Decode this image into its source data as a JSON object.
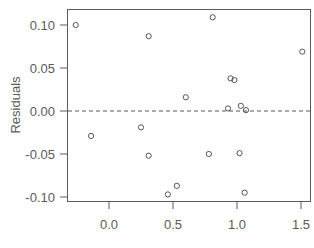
{
  "chart_data": {
    "type": "scatter",
    "title": "",
    "xlabel": "",
    "ylabel": "Residuals",
    "xlim": [
      -0.3,
      1.58
    ],
    "ylim": [
      -0.106,
      0.118
    ],
    "xticks": [
      0.0,
      0.5,
      1.0,
      1.5
    ],
    "xtick_labels": [
      "0.0",
      "0.5",
      "1.0",
      "1.5"
    ],
    "yticks": [
      -0.1,
      -0.05,
      0.0,
      0.05,
      0.1
    ],
    "ytick_labels": [
      "-0.10",
      "-0.05",
      "0.00",
      "0.05",
      "0.10"
    ],
    "grid": false,
    "legend": null,
    "reference_line": {
      "y": 0.0,
      "style": "dashed"
    },
    "points": [
      {
        "x": -0.26,
        "y": 0.1
      },
      {
        "x": -0.14,
        "y": -0.029
      },
      {
        "x": 0.25,
        "y": -0.019
      },
      {
        "x": 0.31,
        "y": 0.087
      },
      {
        "x": 0.31,
        "y": -0.052
      },
      {
        "x": 0.46,
        "y": -0.097
      },
      {
        "x": 0.53,
        "y": -0.087
      },
      {
        "x": 0.6,
        "y": 0.016
      },
      {
        "x": 0.78,
        "y": -0.05
      },
      {
        "x": 0.81,
        "y": 0.109
      },
      {
        "x": 0.93,
        "y": 0.003
      },
      {
        "x": 0.95,
        "y": 0.038
      },
      {
        "x": 0.98,
        "y": 0.036
      },
      {
        "x": 1.02,
        "y": -0.049
      },
      {
        "x": 1.03,
        "y": 0.006
      },
      {
        "x": 1.06,
        "y": -0.095
      },
      {
        "x": 1.07,
        "y": 0.001
      },
      {
        "x": 1.51,
        "y": 0.069
      }
    ]
  },
  "colors": {
    "axis": "#5a5a5a",
    "point": "#555555",
    "reference_line": "#555555"
  }
}
